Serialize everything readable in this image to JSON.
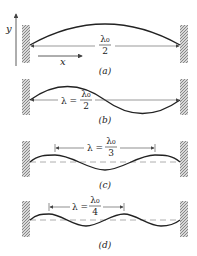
{
  "axes": {
    "y_label": "y",
    "x_label": "x"
  },
  "panels": [
    {
      "id": "a",
      "caption": "(a)",
      "lambda_prefix": "",
      "numerator": "λ₀",
      "denominator": "2",
      "description": "fundamental: half wavelength arch spanning walls"
    },
    {
      "id": "b",
      "caption": "(b)",
      "lambda_prefix": "λ =",
      "numerator": "λ₀",
      "denominator": "2",
      "description": "one full wavelength between walls"
    },
    {
      "id": "c",
      "caption": "(c)",
      "lambda_prefix": "λ =",
      "numerator": "λ₀",
      "denominator": "3",
      "description": "three half-wavelengths, dashed equilibrium line"
    },
    {
      "id": "d",
      "caption": "(d)",
      "lambda_prefix": "λ =",
      "numerator": "λ₀",
      "denominator": "4",
      "description": "four half-wavelengths, dashed equilibrium line"
    }
  ],
  "colors": {
    "ink": "#222222",
    "wall_hatch": "#888888",
    "dash": "#999999"
  }
}
